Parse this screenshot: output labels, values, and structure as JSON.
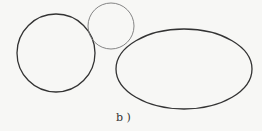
{
  "figure": {
    "label": "b )",
    "shapes": [
      {
        "name": "large-circle",
        "type": "circle",
        "cx": 56,
        "cy": 53,
        "r": 39,
        "stroke": "#333333",
        "stroke_width": 1.3
      },
      {
        "name": "small-circle",
        "type": "circle",
        "cx": 111,
        "cy": 26,
        "r": 23,
        "stroke": "#777777",
        "stroke_width": 0.9
      },
      {
        "name": "ellipse",
        "type": "ellipse",
        "cx": 184,
        "cy": 69,
        "rx": 68,
        "ry": 40,
        "stroke": "#333333",
        "stroke_width": 1.3
      }
    ]
  }
}
